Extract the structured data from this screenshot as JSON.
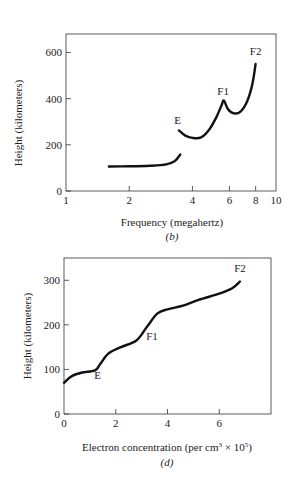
{
  "chart_data": [
    {
      "id": "b",
      "type": "line",
      "title": "",
      "caption": "(b)",
      "xlabel": "Frequency (megahertz)",
      "ylabel": "Height (kilometers)",
      "xscale": "log",
      "xlim": [
        1,
        10
      ],
      "ylim": [
        0,
        680
      ],
      "xticks": [
        1,
        2,
        4,
        6,
        8,
        10
      ],
      "xtick_labels": [
        "1",
        "2",
        "4",
        "6",
        "8",
        "10"
      ],
      "yticks": [
        0,
        200,
        400,
        600
      ],
      "ytick_labels": [
        "0",
        "200",
        "400",
        "600"
      ],
      "grid": false,
      "legend": null,
      "series": [
        {
          "name": "lower segment",
          "x": [
            1.6,
            2.0,
            2.5,
            3.0,
            3.3,
            3.5
          ],
          "y": [
            106,
            107,
            109,
            115,
            130,
            158
          ]
        },
        {
          "name": "upper segment",
          "x": [
            3.45,
            3.7,
            4.0,
            4.4,
            4.8,
            5.2,
            5.5,
            5.65,
            5.9,
            6.3,
            6.8,
            7.3,
            7.7,
            8.0
          ],
          "y": [
            262,
            240,
            230,
            232,
            265,
            320,
            370,
            392,
            355,
            336,
            345,
            390,
            460,
            550
          ]
        }
      ],
      "annotations": [
        {
          "text": "E",
          "x": 3.4,
          "y": 290
        },
        {
          "text": "F1",
          "x": 5.6,
          "y": 415
        },
        {
          "text": "F2",
          "x": 8.0,
          "y": 590
        }
      ]
    },
    {
      "id": "d",
      "type": "line",
      "title": "",
      "caption": "(d)",
      "xlabel": "Electron concentration (per cm³ × 10⁵)",
      "ylabel": "Height (kilometers)",
      "xlim": [
        0,
        8
      ],
      "ylim": [
        0,
        350
      ],
      "xticks": [
        0,
        2,
        4,
        6
      ],
      "xtick_labels": [
        "0",
        "2",
        "4",
        "6"
      ],
      "yticks": [
        0,
        100,
        200,
        300
      ],
      "ytick_labels": [
        "0",
        "100",
        "200",
        "300"
      ],
      "grid": false,
      "legend": null,
      "series": [
        {
          "name": "profile",
          "x": [
            0,
            0.3,
            0.7,
            1.2,
            1.4,
            1.7,
            2.2,
            2.8,
            3.2,
            3.6,
            4.0,
            4.6,
            5.2,
            6.0,
            6.5,
            6.8
          ],
          "y": [
            70,
            85,
            93,
            98,
            112,
            135,
            150,
            165,
            195,
            225,
            235,
            243,
            256,
            270,
            282,
            297
          ]
        }
      ],
      "annotations": [
        {
          "text": "E",
          "x": 1.3,
          "y": 78
        },
        {
          "text": "F1",
          "x": 3.4,
          "y": 165
        },
        {
          "text": "F2",
          "x": 6.8,
          "y": 318
        }
      ]
    }
  ],
  "labels": {
    "b_xlabel": "Frequency (megahertz)",
    "b_ylabel": "Height (kilometers)",
    "b_caption": "(b)",
    "d_xlabel_main": "Electron concentration (per cm",
    "d_xlabel_sup1": "3",
    "d_xlabel_mid": " × 10",
    "d_xlabel_sup2": "5",
    "d_xlabel_end": ")",
    "d_ylabel": "Height (kilometers)",
    "d_caption": "(d)"
  },
  "style": {
    "line_color": "#111111",
    "axis_color": "#333333"
  }
}
